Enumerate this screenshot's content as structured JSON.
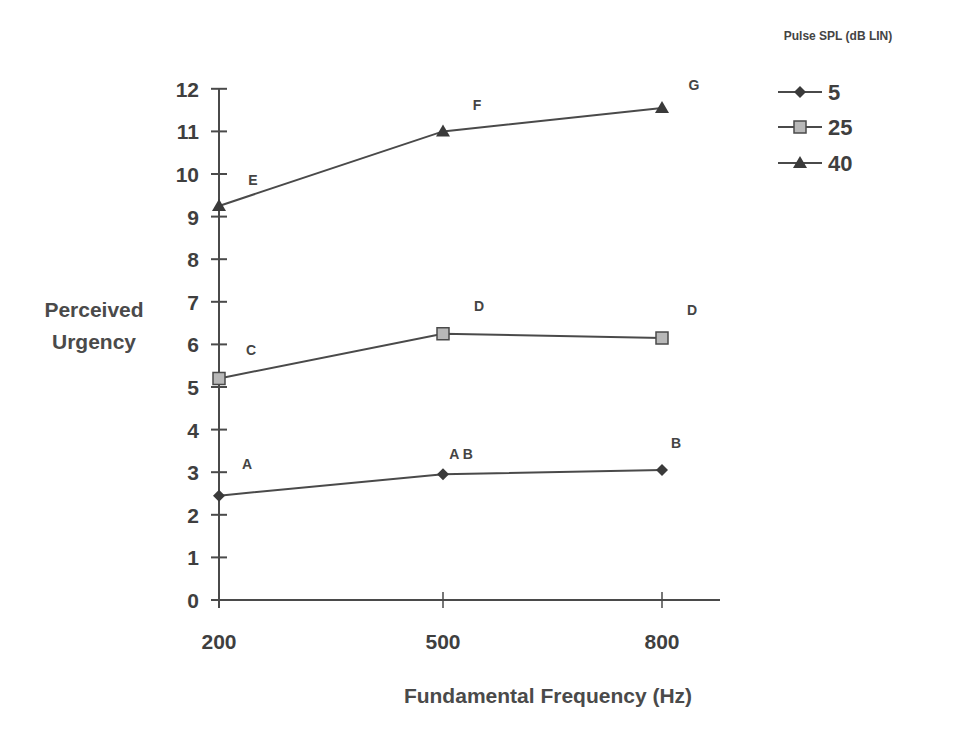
{
  "chart_data": {
    "type": "line",
    "title": "",
    "xlabel": "Fundamental Frequency (Hz)",
    "ylabel": "Perceived Urgency",
    "ylabel_lines": [
      "Perceived",
      "Urgency"
    ],
    "categories": [
      "200",
      "500",
      "800"
    ],
    "ylim": [
      0,
      12
    ],
    "yticks": [
      0,
      1,
      2,
      3,
      4,
      5,
      6,
      7,
      8,
      9,
      10,
      11,
      12
    ],
    "grid": false,
    "legend": {
      "title": "Pulse SPL (dB LIN)",
      "position": "top-right",
      "entries": [
        "5",
        "25",
        "40"
      ]
    },
    "series": [
      {
        "name": "5",
        "marker": "diamond",
        "values": [
          2.45,
          2.95,
          3.05
        ],
        "point_labels": [
          "A",
          "A B",
          "B"
        ]
      },
      {
        "name": "25",
        "marker": "square",
        "values": [
          5.2,
          6.25,
          6.15
        ],
        "point_labels": [
          "C",
          "D",
          "D"
        ]
      },
      {
        "name": "40",
        "marker": "triangle",
        "values": [
          9.25,
          11.0,
          11.55
        ],
        "point_labels": [
          "E",
          "F",
          "G"
        ]
      }
    ]
  },
  "colors": {
    "line": "#4a4a4a",
    "diamond_fill": "#3a3a3a",
    "square_fill": "#b8b8b8",
    "triangle_fill": "#3a3a3a",
    "text": "#3f3f3f"
  }
}
